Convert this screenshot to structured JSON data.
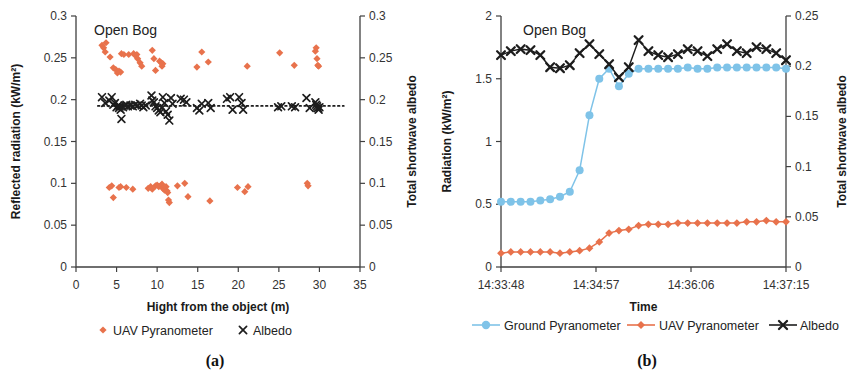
{
  "figure": {
    "panel_a_label": "(a)",
    "panel_b_label": "(b)"
  },
  "panel_a": {
    "title": "Open Bog",
    "y_left_label": "Reflected radiation (kW/m²)",
    "y_right_label": "Total shortwave albedo",
    "x_label": "Hight from the object (m)",
    "legend": [
      {
        "name": "UAV Pyranometer",
        "marker": "diamond",
        "color": "#E8724C"
      },
      {
        "name": "Albedo",
        "marker": "x",
        "color": "#1d1d1d"
      }
    ],
    "colors": {
      "uav": "#E8724C",
      "albedo": "#1d1d1d",
      "axis": "#404040"
    }
  },
  "panel_b": {
    "title": "Open Bog",
    "y_left_label": "Radiation (kW/m²)",
    "y_right_label": "Total shortwave albedo",
    "x_label": "Time",
    "legend": [
      {
        "name": "Ground Pyranometer",
        "marker": "circle",
        "color": "#7FC3E8"
      },
      {
        "name": "UAV Pyranometer",
        "marker": "diamond",
        "color": "#E8724C"
      },
      {
        "name": "Albedo",
        "marker": "x",
        "color": "#1d1d1d"
      }
    ],
    "colors": {
      "ground": "#7FC3E8",
      "uav": "#E8724C",
      "albedo": "#1d1d1d",
      "axis": "#404040"
    }
  },
  "chart_data": [
    {
      "id": "panel_a",
      "type": "scatter",
      "title": "Open Bog",
      "xlabel": "Hight from the object (m)",
      "ylabel": "Reflected radiation (kW/m²)",
      "y2label": "Total shortwave albedo",
      "xlim": [
        0,
        35
      ],
      "ylim": [
        0,
        0.3
      ],
      "y2lim": [
        0,
        0.3
      ],
      "xticks": [
        0,
        5,
        10,
        15,
        20,
        25,
        30,
        35
      ],
      "yticks": [
        0,
        0.05,
        0.1,
        0.15,
        0.2,
        0.25,
        0.3
      ],
      "y2ticks": [
        0,
        0.05,
        0.1,
        0.15,
        0.2,
        0.25,
        0.3
      ],
      "grid": false,
      "legend_position": "below",
      "trendline": {
        "label": "albedo mean",
        "y": 0.1925,
        "style": "dotted",
        "x_from": 2.7,
        "x_to": 33.0
      },
      "series": [
        {
          "name": "UAV Pyranometer",
          "marker": "diamond",
          "color": "#E8724C",
          "points": [
            [
              3.2,
              0.265
            ],
            [
              3.4,
              0.262
            ],
            [
              3.6,
              0.257
            ],
            [
              3.7,
              0.268
            ],
            [
              4.2,
              0.251
            ],
            [
              4.6,
              0.238
            ],
            [
              4.9,
              0.236
            ],
            [
              5.1,
              0.232
            ],
            [
              5.3,
              0.234
            ],
            [
              5.5,
              0.233
            ],
            [
              5.6,
              0.255
            ],
            [
              5.9,
              0.254
            ],
            [
              6.5,
              0.254
            ],
            [
              7.1,
              0.255
            ],
            [
              7.3,
              0.253
            ],
            [
              7.5,
              0.254
            ],
            [
              7.6,
              0.249
            ],
            [
              7.9,
              0.244
            ],
            [
              8.1,
              0.24
            ],
            [
              9.4,
              0.259
            ],
            [
              9.6,
              0.249
            ],
            [
              9.8,
              0.235
            ],
            [
              10.3,
              0.246
            ],
            [
              10.5,
              0.244
            ],
            [
              10.6,
              0.24
            ],
            [
              10.7,
              0.243
            ],
            [
              14.9,
              0.239
            ],
            [
              15.5,
              0.257
            ],
            [
              16.3,
              0.245
            ],
            [
              21.1,
              0.24
            ],
            [
              25.1,
              0.256
            ],
            [
              26.9,
              0.241
            ],
            [
              29.5,
              0.258
            ],
            [
              29.6,
              0.262
            ],
            [
              29.7,
              0.249
            ],
            [
              29.8,
              0.241
            ],
            [
              29.9,
              0.24
            ],
            [
              4.1,
              0.095
            ],
            [
              4.4,
              0.097
            ],
            [
              4.6,
              0.083
            ],
            [
              5.3,
              0.095
            ],
            [
              5.5,
              0.096
            ],
            [
              6.2,
              0.095
            ],
            [
              7.0,
              0.093
            ],
            [
              8.9,
              0.094
            ],
            [
              9.2,
              0.096
            ],
            [
              9.4,
              0.093
            ],
            [
              9.8,
              0.097
            ],
            [
              10.0,
              0.098
            ],
            [
              10.2,
              0.096
            ],
            [
              10.4,
              0.097
            ],
            [
              10.6,
              0.099
            ],
            [
              10.7,
              0.094
            ],
            [
              10.9,
              0.092
            ],
            [
              11.1,
              0.096
            ],
            [
              11.2,
              0.091
            ],
            [
              11.3,
              0.089
            ],
            [
              11.4,
              0.08
            ],
            [
              11.5,
              0.077
            ],
            [
              12.5,
              0.097
            ],
            [
              13.4,
              0.1
            ],
            [
              13.8,
              0.084
            ],
            [
              16.5,
              0.079
            ],
            [
              19.9,
              0.095
            ],
            [
              20.8,
              0.09
            ],
            [
              21.2,
              0.096
            ],
            [
              28.5,
              0.1
            ],
            [
              28.6,
              0.097
            ]
          ]
        },
        {
          "name": "Albedo",
          "marker": "x",
          "color": "#1d1d1d",
          "points": [
            [
              3.2,
              0.203
            ],
            [
              3.6,
              0.196
            ],
            [
              4.1,
              0.199
            ],
            [
              4.4,
              0.203
            ],
            [
              4.6,
              0.194
            ],
            [
              4.8,
              0.196
            ],
            [
              5.0,
              0.191
            ],
            [
              5.2,
              0.193
            ],
            [
              5.3,
              0.19
            ],
            [
              5.4,
              0.192
            ],
            [
              5.5,
              0.188
            ],
            [
              5.6,
              0.177
            ],
            [
              5.8,
              0.191
            ],
            [
              6.0,
              0.193
            ],
            [
              6.2,
              0.194
            ],
            [
              6.4,
              0.192
            ],
            [
              6.7,
              0.193
            ],
            [
              7.0,
              0.192
            ],
            [
              7.3,
              0.194
            ],
            [
              7.6,
              0.193
            ],
            [
              7.9,
              0.195
            ],
            [
              8.1,
              0.193
            ],
            [
              8.3,
              0.191
            ],
            [
              8.6,
              0.193
            ],
            [
              9.3,
              0.205
            ],
            [
              9.4,
              0.199
            ],
            [
              9.6,
              0.197
            ],
            [
              9.8,
              0.192
            ],
            [
              10.0,
              0.19
            ],
            [
              10.2,
              0.187
            ],
            [
              10.4,
              0.185
            ],
            [
              10.6,
              0.19
            ],
            [
              10.7,
              0.203
            ],
            [
              10.9,
              0.196
            ],
            [
              11.1,
              0.186
            ],
            [
              11.3,
              0.182
            ],
            [
              11.5,
              0.175
            ],
            [
              11.7,
              0.202
            ],
            [
              11.9,
              0.195
            ],
            [
              12.9,
              0.201
            ],
            [
              13.3,
              0.2
            ],
            [
              13.6,
              0.197
            ],
            [
              14.9,
              0.19
            ],
            [
              15.2,
              0.187
            ],
            [
              15.5,
              0.195
            ],
            [
              16.3,
              0.196
            ],
            [
              16.6,
              0.19
            ],
            [
              18.6,
              0.201
            ],
            [
              19.0,
              0.203
            ],
            [
              19.3,
              0.188
            ],
            [
              20.1,
              0.203
            ],
            [
              20.4,
              0.196
            ],
            [
              20.6,
              0.188
            ],
            [
              24.9,
              0.191
            ],
            [
              25.3,
              0.192
            ],
            [
              26.6,
              0.192
            ],
            [
              27.0,
              0.191
            ],
            [
              28.4,
              0.202
            ],
            [
              28.8,
              0.19
            ],
            [
              29.5,
              0.197
            ],
            [
              29.6,
              0.194
            ],
            [
              29.7,
              0.192
            ],
            [
              29.8,
              0.19
            ],
            [
              29.9,
              0.188
            ],
            [
              30.0,
              0.191
            ]
          ]
        }
      ]
    },
    {
      "id": "panel_b",
      "type": "line",
      "title": "Open Bog",
      "xlabel": "Time",
      "ylabel": "Radiation (kW/m²)",
      "y2label": "Total shortwave albedo",
      "ylim": [
        0,
        2
      ],
      "y2lim": [
        0,
        0.25
      ],
      "yticks": [
        0,
        0.5,
        1,
        1.5,
        2
      ],
      "y2ticks": [
        0,
        0.05,
        0.1,
        0.15,
        0.2,
        0.25
      ],
      "xticklabels": [
        "14:33:48",
        "14:34:57",
        "14:36:06",
        "14:37:15"
      ],
      "xtickpos": [
        0,
        0.3333,
        0.6667,
        1.0
      ],
      "grid": false,
      "legend_position": "below",
      "n_points": 30,
      "series": [
        {
          "name": "Ground Pyranometer",
          "axis": "left",
          "marker": "circle",
          "color": "#7FC3E8",
          "values": [
            0.52,
            0.52,
            0.52,
            0.52,
            0.53,
            0.54,
            0.56,
            0.6,
            0.77,
            1.21,
            1.5,
            1.58,
            1.44,
            1.54,
            1.58,
            1.58,
            1.58,
            1.58,
            1.58,
            1.59,
            1.58,
            1.58,
            1.59,
            1.59,
            1.59,
            1.59,
            1.59,
            1.59,
            1.59,
            1.58
          ]
        },
        {
          "name": "UAV Pyranometer",
          "axis": "left",
          "marker": "diamond",
          "color": "#E8724C",
          "values": [
            0.11,
            0.12,
            0.12,
            0.12,
            0.12,
            0.12,
            0.11,
            0.12,
            0.13,
            0.15,
            0.2,
            0.27,
            0.29,
            0.3,
            0.33,
            0.34,
            0.34,
            0.34,
            0.35,
            0.35,
            0.35,
            0.35,
            0.35,
            0.35,
            0.35,
            0.36,
            0.36,
            0.37,
            0.36,
            0.36
          ]
        },
        {
          "name": "Albedo",
          "axis": "right",
          "marker": "x",
          "color": "#1d1d1d",
          "values": [
            0.211,
            0.215,
            0.217,
            0.216,
            0.211,
            0.199,
            0.198,
            0.201,
            0.213,
            0.222,
            0.212,
            0.202,
            0.189,
            0.199,
            0.226,
            0.215,
            0.211,
            0.209,
            0.212,
            0.217,
            0.215,
            0.21,
            0.217,
            0.222,
            0.215,
            0.213,
            0.219,
            0.217,
            0.213,
            0.206
          ]
        }
      ]
    }
  ]
}
